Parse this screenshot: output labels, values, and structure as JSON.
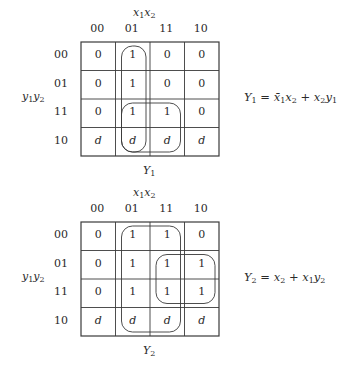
{
  "maps": [
    {
      "id": "Y1",
      "column_variable_label": {
        "base": "x",
        "terms": [
          [
            "x",
            "1"
          ],
          [
            "x",
            "2"
          ]
        ]
      },
      "row_variable_label": {
        "terms": [
          [
            "y",
            "1"
          ],
          [
            "y",
            "2"
          ]
        ]
      },
      "column_headers": [
        "00",
        "01",
        "11",
        "10"
      ],
      "row_headers": [
        "00",
        "01",
        "11",
        "10"
      ],
      "cells": [
        [
          "0",
          "1",
          "0",
          "0"
        ],
        [
          "0",
          "1",
          "0",
          "0"
        ],
        [
          "0",
          "1",
          "1",
          "0"
        ],
        [
          "d",
          "d",
          "d",
          "d"
        ]
      ],
      "groupings": [
        {
          "rows": [
            0,
            3
          ],
          "cols": [
            1,
            1
          ]
        },
        {
          "rows": [
            2,
            3
          ],
          "cols": [
            1,
            2
          ]
        }
      ],
      "caption": {
        "base": "Y",
        "sub": "1"
      },
      "equation": {
        "lhs": [
          "Y",
          "1"
        ],
        "terms": [
          [
            [
              "x̄",
              "1"
            ],
            [
              "x",
              "2"
            ]
          ],
          [
            [
              "x",
              "2"
            ],
            [
              "y",
              "1"
            ]
          ]
        ]
      }
    },
    {
      "id": "Y2",
      "column_variable_label": {
        "terms": [
          [
            "x",
            "1"
          ],
          [
            "x",
            "2"
          ]
        ]
      },
      "row_variable_label": {
        "terms": [
          [
            "y",
            "1"
          ],
          [
            "y",
            "2"
          ]
        ]
      },
      "column_headers": [
        "00",
        "01",
        "11",
        "10"
      ],
      "row_headers": [
        "00",
        "01",
        "11",
        "10"
      ],
      "cells": [
        [
          "0",
          "1",
          "1",
          "0"
        ],
        [
          "0",
          "1",
          "1",
          "1"
        ],
        [
          "0",
          "1",
          "1",
          "1"
        ],
        [
          "d",
          "d",
          "d",
          "d"
        ]
      ],
      "groupings": [
        {
          "rows": [
            0,
            3
          ],
          "cols": [
            1,
            2
          ]
        },
        {
          "rows": [
            1,
            2
          ],
          "cols": [
            2,
            3
          ]
        }
      ],
      "caption": {
        "base": "Y",
        "sub": "2"
      },
      "equation": {
        "lhs": [
          "Y",
          "2"
        ],
        "terms": [
          [
            [
              "x",
              "2"
            ]
          ],
          [
            [
              "x",
              "1"
            ],
            [
              "y",
              "2"
            ]
          ]
        ]
      }
    }
  ],
  "labels": {
    "equals": "=",
    "plus": "+"
  }
}
